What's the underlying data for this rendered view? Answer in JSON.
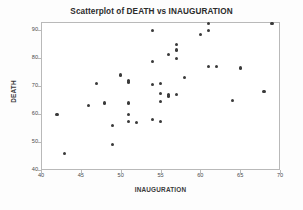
{
  "chart_data": {
    "type": "scatter",
    "title": "Scatterplot of DEATH vs INAUGURATION",
    "xlabel": "INAUGURATION",
    "ylabel": "DEATH",
    "xlim": [
      40,
      70
    ],
    "ylim": [
      40,
      93
    ],
    "xticks": [
      40,
      45,
      50,
      55,
      60,
      65,
      70
    ],
    "yticks": [
      40,
      50,
      60,
      70,
      80,
      90
    ],
    "grid": false,
    "legend": null,
    "marker": "filled-circle",
    "marker_color": "#3a3a3a",
    "series": [
      {
        "name": "DEATH vs INAUGURATION",
        "points": [
          [
            42.0,
            60.0
          ],
          [
            43.0,
            46.0
          ],
          [
            46.0,
            63.0
          ],
          [
            47.0,
            71.0
          ],
          [
            48.0,
            64.0
          ],
          [
            49.0,
            56.0
          ],
          [
            49.0,
            49.0
          ],
          [
            50.0,
            74.0
          ],
          [
            51.0,
            72.0
          ],
          [
            51.0,
            71.5
          ],
          [
            51.0,
            64.0
          ],
          [
            51.0,
            60.0
          ],
          [
            51.0,
            57.5
          ],
          [
            52.0,
            57.0
          ],
          [
            54.0,
            90.0
          ],
          [
            54.0,
            79.0
          ],
          [
            54.0,
            70.5
          ],
          [
            54.0,
            58.0
          ],
          [
            55.0,
            71.0
          ],
          [
            55.0,
            67.5
          ],
          [
            55.0,
            64.5
          ],
          [
            55.0,
            57.5
          ],
          [
            56.0,
            81.5
          ],
          [
            56.0,
            67.0
          ],
          [
            56.0,
            66.5
          ],
          [
            57.0,
            85.0
          ],
          [
            57.0,
            83.0
          ],
          [
            57.0,
            80.0
          ],
          [
            57.0,
            67.0
          ],
          [
            58.0,
            73.0
          ],
          [
            60.0,
            88.5
          ],
          [
            61.0,
            92.5
          ],
          [
            61.0,
            90.0
          ],
          [
            61.0,
            77.0
          ],
          [
            62.0,
            77.0
          ],
          [
            64.0,
            65.0
          ],
          [
            65.0,
            76.5
          ],
          [
            68.0,
            68.0
          ],
          [
            69.0,
            92.5
          ]
        ]
      }
    ]
  }
}
